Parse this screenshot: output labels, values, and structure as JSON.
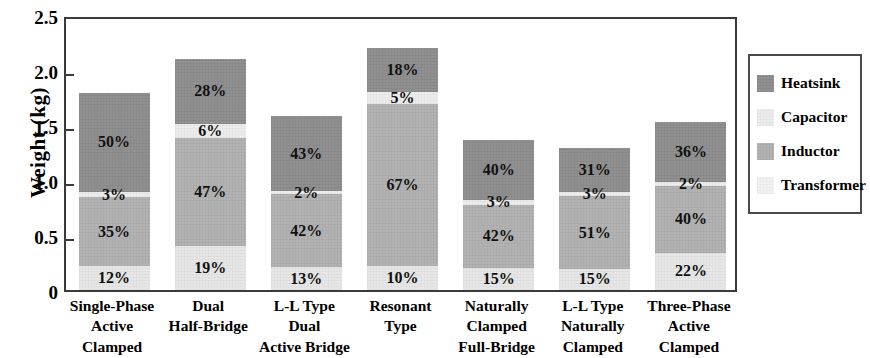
{
  "chart_data": {
    "type": "bar",
    "subtype": "stacked-bar",
    "title": "",
    "xlabel": "",
    "ylabel": "Weight (kg)",
    "ylim": [
      0,
      2.5
    ],
    "yticks": [
      "0",
      "0.5",
      "1.0",
      "1.5",
      "2.0",
      "2.5"
    ],
    "ytick_values": [
      0,
      0.5,
      1.0,
      1.5,
      2.0,
      2.5
    ],
    "grid": false,
    "legend_position": "right-outside",
    "stack_order_bottom_to_top": [
      "Transformer",
      "Inductor",
      "Capacitor",
      "Heatsink"
    ],
    "categories": [
      "Single-Phase Active Clamped",
      "Dual Half-Bridge",
      "L-L Type Dual Active Bridge",
      "Resonant Type",
      "Naturally Clamped Full-Bridge",
      "L-L Type Naturally Clamped",
      "Three-Phase Active Clamped"
    ],
    "category_lines": [
      [
        "Single-Phase",
        "Active",
        "Clamped"
      ],
      [
        "Dual",
        "Half-Bridge"
      ],
      [
        "L-L Type",
        "Dual",
        "Active Bridge"
      ],
      [
        "Resonant",
        "Type"
      ],
      [
        "Naturally",
        "Clamped",
        "Full-Bridge"
      ],
      [
        "L-L Type",
        "Naturally",
        "Clamped"
      ],
      [
        "Three-Phase",
        "Active",
        "Clamped"
      ]
    ],
    "totals_kg": [
      1.79,
      2.1,
      1.58,
      2.2,
      1.36,
      1.29,
      1.53
    ],
    "series": [
      {
        "name": "Heatsink",
        "color": "#8c8c8c",
        "values": [
          50,
          28,
          43,
          18,
          40,
          31,
          36
        ],
        "labels": [
          "50%",
          "28%",
          "43%",
          "18%",
          "40%",
          "31%",
          "36%"
        ]
      },
      {
        "name": "Capacitor",
        "color": "#ececec",
        "values": [
          3,
          6,
          2,
          5,
          3,
          3,
          2
        ],
        "labels": [
          "3%",
          "6%",
          "2%",
          "5%",
          "3%",
          "3%",
          "2%"
        ]
      },
      {
        "name": "Inductor",
        "color": "#b0b0b0",
        "values": [
          35,
          47,
          42,
          67,
          42,
          51,
          40
        ],
        "labels": [
          "35%",
          "47%",
          "42%",
          "67%",
          "42%",
          "51%",
          "40%"
        ]
      },
      {
        "name": "Transformer",
        "color": "#e6e6e6",
        "values": [
          12,
          19,
          13,
          10,
          15,
          15,
          22
        ],
        "labels": [
          "12%",
          "19%",
          "13%",
          "10%",
          "15%",
          "15%",
          "22%"
        ]
      }
    ]
  },
  "legend": {
    "items": [
      {
        "label": "Heatsink",
        "color": "#8c8c8c"
      },
      {
        "label": "Capacitor",
        "color": "#ececec"
      },
      {
        "label": "Inductor",
        "color": "#b0b0b0"
      },
      {
        "label": "Transformer",
        "color": "#f2f2f2"
      }
    ]
  },
  "axis": {
    "ylabel": "Weight (kg)",
    "frame_color": "#3a3a3a"
  }
}
